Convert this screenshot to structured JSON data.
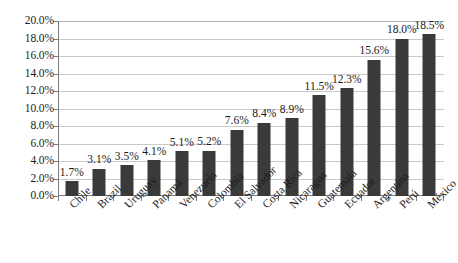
{
  "chart_data": {
    "type": "bar",
    "title": "",
    "subtitle": "",
    "xlabel": "",
    "ylabel": "",
    "ylim": [
      0,
      20
    ],
    "ytick_labels": [
      "0.0%",
      "2.0%",
      "4.0%",
      "6.0%",
      "8.0%",
      "10.0%",
      "12.0%",
      "14.0%",
      "16.0%",
      "18.0%",
      "20.0%"
    ],
    "ytick_values": [
      0,
      2,
      4,
      6,
      8,
      10,
      12,
      14,
      16,
      18,
      20
    ],
    "grid": true,
    "legend": "none",
    "categories": [
      "Chile",
      "Brazil",
      "Uruguay",
      "Panamá",
      "Venezuela",
      "Colombia",
      "El Salvador",
      "Costa Rica",
      "Nicaragua",
      "Guatemala",
      "Ecuador",
      "Argentina",
      "Perú",
      "México"
    ],
    "values": [
      1.7,
      3.1,
      3.5,
      4.1,
      5.1,
      5.2,
      7.6,
      8.4,
      8.9,
      11.5,
      12.3,
      15.6,
      18.0,
      18.5
    ],
    "data_labels": [
      "1.7%",
      "3.1%",
      "3.5%",
      "4.1%",
      "5.1%",
      "5.2%",
      "7.6%",
      "8.4%",
      "8.9%",
      "11.5%",
      "12.3%",
      "15.6%",
      "18.0%",
      "18.5%"
    ],
    "colors": {
      "bar_fill": "#3a3a3a",
      "grid_line": "#c9c9c9",
      "axis_line": "#7d7d7d",
      "text": "#1a1a1a",
      "background": "#ffffff"
    }
  }
}
